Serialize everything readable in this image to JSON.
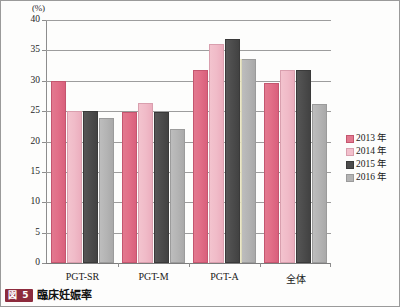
{
  "figure": {
    "unit_label": "(%)",
    "caption_badge": "図 5",
    "caption_text": "臨床妊娠率"
  },
  "legend": {
    "position": "right",
    "items": [
      {
        "label": "2013 年",
        "color": "#e2798f"
      },
      {
        "label": "2014 年",
        "color": "#f2c0cc"
      },
      {
        "label": "2015 年",
        "color": "#4c4c4c"
      },
      {
        "label": "2016 年",
        "color": "#b4b4b4"
      }
    ]
  },
  "chart_data": {
    "type": "bar",
    "title": "臨床妊娠率",
    "xlabel": "",
    "ylabel": "(%)",
    "ylim": [
      0,
      40
    ],
    "yticks": [
      0,
      5,
      10,
      15,
      20,
      25,
      30,
      35,
      40
    ],
    "ytick_labels": [
      "0",
      "5",
      "10",
      "15",
      "20",
      "25",
      "30",
      "35",
      "40"
    ],
    "grid": true,
    "categories": [
      "PGT-SR",
      "PGT-M",
      "PGT-A",
      "全体"
    ],
    "series": [
      {
        "name": "2013 年",
        "color": "#e2798f",
        "values": [
          30.0,
          24.9,
          31.8,
          29.6
        ]
      },
      {
        "name": "2014 年",
        "color": "#f2c0cc",
        "values": [
          25.0,
          26.3,
          36.1,
          31.8
        ]
      },
      {
        "name": "2015 年",
        "color": "#4c4c4c",
        "values": [
          25.0,
          24.9,
          36.8,
          31.7
        ]
      },
      {
        "name": "2016 年",
        "color": "#b4b4b4",
        "values": [
          23.8,
          22.1,
          33.6,
          26.1
        ]
      }
    ]
  }
}
